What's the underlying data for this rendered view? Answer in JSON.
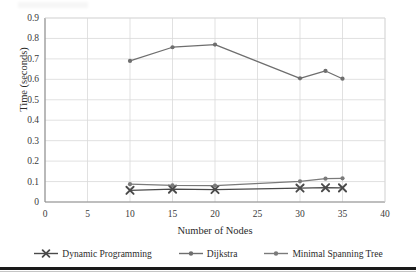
{
  "chart_data": {
    "type": "line",
    "title": "",
    "xlabel": "Number of Nodes",
    "ylabel": "Time (seconds)",
    "xlim": [
      0,
      40
    ],
    "ylim": [
      0,
      0.9
    ],
    "xticks": [
      "0",
      "5",
      "10",
      "15",
      "20",
      "25",
      "30",
      "35",
      "40"
    ],
    "yticks": [
      "0",
      "0.1",
      "0.2",
      "0.3",
      "0.4",
      "0.5",
      "0.6",
      "0.7",
      "0.8",
      "0.9"
    ],
    "grid": "horizontal-and-vertical",
    "legend_position": "bottom",
    "x": [
      10,
      15,
      20,
      30,
      33,
      35
    ],
    "series": [
      {
        "name": "Dynamic Programming",
        "marker": "x-marker",
        "color": "#4a4a4a",
        "values": [
          0.057,
          0.063,
          0.061,
          0.068,
          0.07,
          0.069
        ]
      },
      {
        "name": "Dijkstra",
        "marker": "dot-marker",
        "color": "#6e6e6e",
        "values": [
          0.69,
          0.757,
          0.77,
          0.605,
          0.641,
          0.603
        ]
      },
      {
        "name": "Minimal Spanning Tree",
        "marker": "dot-marker",
        "color": "#7a7a7a",
        "values": [
          0.087,
          0.081,
          0.08,
          0.101,
          0.114,
          0.116
        ]
      }
    ]
  },
  "axes": {
    "y_title": "Time (seconds)",
    "x_title": "Number of Nodes",
    "y_tick_labels": [
      "0.9",
      "0.8",
      "0.7",
      "0.6",
      "0.5",
      "0.4",
      "0.3",
      "0.2",
      "0.1",
      "0"
    ],
    "x_tick_labels": [
      "0",
      "5",
      "10",
      "15",
      "20",
      "25",
      "30",
      "35",
      "40"
    ]
  },
  "legend": {
    "items": [
      {
        "label": "Dynamic Programming",
        "marker": "x-marker"
      },
      {
        "label": "Dijkstra",
        "marker": "dot-marker"
      },
      {
        "label": "Minimal Spanning Tree",
        "marker": "dot-marker"
      }
    ]
  },
  "colors": {
    "series_dynamic_programming": "#4a4a4a",
    "series_dijkstra": "#6e6e6e",
    "series_mst": "#7a7a7a",
    "grid": "#d9d9d9",
    "axis": "#8c8c8c",
    "text": "#2f2f2f",
    "rule": "#1a1a1a"
  }
}
